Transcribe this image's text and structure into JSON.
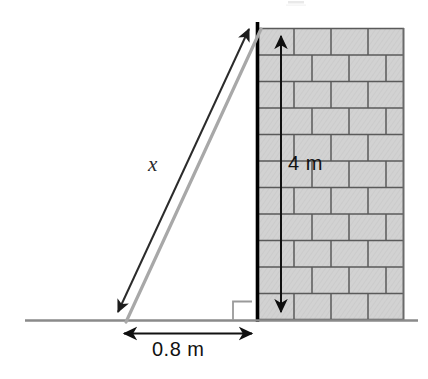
{
  "figure": {
    "kind": "geometry-diagram",
    "background_color": "#ffffff"
  },
  "labels": {
    "hypotenuse": "x",
    "wall_height": "4 m",
    "ground_distance": "0.8 m"
  },
  "colors": {
    "brick_fill": "#d2d2d2",
    "brick_stroke": "#555555",
    "wall_edge": "#000000",
    "ground_line": "#808080",
    "ladder_dark": "#2b2b2b",
    "ladder_light": "#a8a8a8",
    "dimension_line": "#111111",
    "right_angle": "#9a9a9a"
  },
  "geometry": {
    "wall": {
      "left": 258,
      "right": 404,
      "top": 28,
      "bottom": 320,
      "brick_rows": 11,
      "row_height": 26.5
    },
    "ground": {
      "y": 320,
      "x_start": 25,
      "x_end": 418
    },
    "ladder": {
      "foot_x": 120,
      "foot_y": 320,
      "top_x": 256,
      "top_y": 28
    },
    "height_arrow": {
      "x": 281,
      "y_top": 30,
      "y_bottom": 318
    },
    "base_arrow": {
      "y": 333,
      "x_left": 118,
      "x_right": 258
    },
    "right_angle_marker": {
      "x": 232,
      "y": 301,
      "size": 19
    }
  }
}
